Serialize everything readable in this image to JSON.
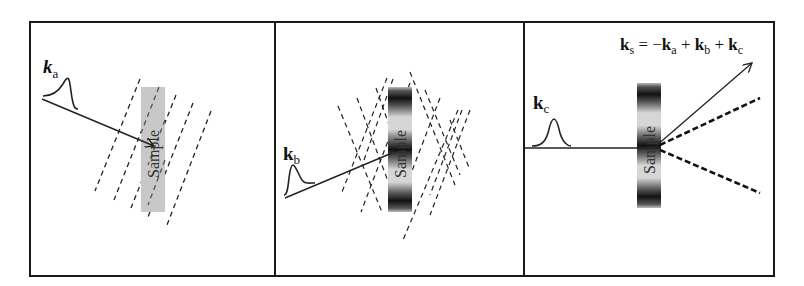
{
  "figure": {
    "panels": [
      {
        "id": "a",
        "beam_label": {
          "main": "k",
          "sub": "a",
          "italic": true
        },
        "sample_label": "Sample",
        "sample_style": "uniform-gray",
        "grating": "single-set-slanted"
      },
      {
        "id": "b",
        "beam_label": {
          "main": "k",
          "sub": "b",
          "italic": false
        },
        "sample_label": "Sample",
        "sample_style": "banded",
        "grating": "crossed-sets"
      },
      {
        "id": "c",
        "beam_label": {
          "main": "k",
          "sub": "c",
          "italic": false
        },
        "sample_label": "Sample",
        "sample_style": "banded",
        "output_equation": {
          "lhs_main": "k",
          "lhs_sub": "s",
          "eq": " = ",
          "t1_sign": "−",
          "t1_main": "k",
          "t1_sub": "a",
          "t2_sign": " + ",
          "t2_main": "k",
          "t2_sub": "b",
          "t3_sign": " + ",
          "t3_main": "k",
          "t3_sub": "c"
        }
      }
    ],
    "colors": {
      "line": "#222222",
      "sample_gray": "#c8c8c8",
      "sample_band": "#1a1a1a",
      "border": "#1a1a1a"
    }
  }
}
